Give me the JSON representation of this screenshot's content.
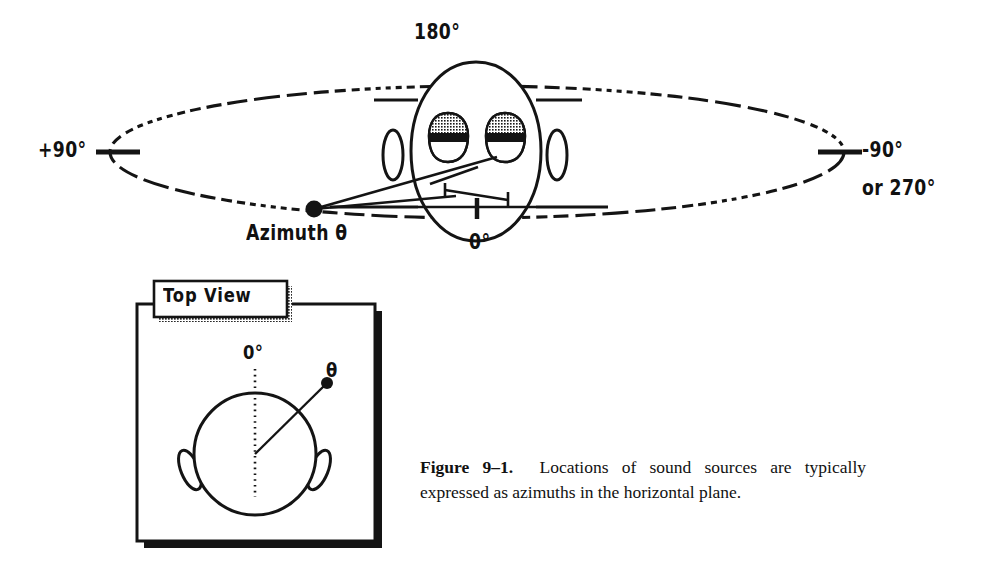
{
  "figure": {
    "id": "figure-9-1",
    "caption_lead": "Figure 9–1.",
    "caption_body": "Locations of sound sources are typically expressed as azimuths in the horizontal plane.",
    "ink_color": "#111111",
    "background_color": "#ffffff"
  },
  "main_diagram": {
    "name": "horizontal-plane-azimuth-diagram",
    "labels": {
      "rear": "180°",
      "left": "+90°",
      "right": "-90°",
      "right_alt": "or 270°",
      "front": "0°",
      "source": "Azimuth θ"
    },
    "head": {
      "name": "head-front-view",
      "eyes": 2,
      "ears": 2
    },
    "plane": {
      "name": "horizontal-plane-ellipse",
      "style": "dashed"
    },
    "source_dot": {
      "name": "sound-source-dot"
    }
  },
  "top_view_panel": {
    "name": "top-view-panel",
    "title": "Top View",
    "labels": {
      "front": "0°",
      "source": "θ"
    },
    "head": {
      "name": "head-top-view",
      "ears": 2
    }
  }
}
